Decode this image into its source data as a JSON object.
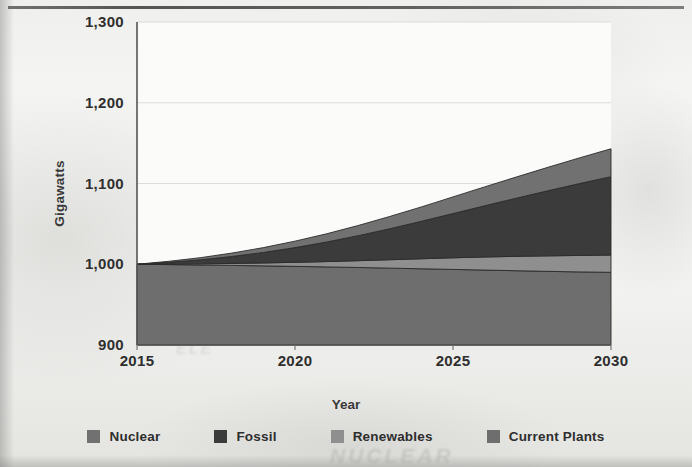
{
  "chart_data": {
    "type": "area",
    "stacked": true,
    "title": "",
    "xlabel": "Year",
    "ylabel": "Gigawatts",
    "x": [
      2015,
      2016,
      2017,
      2018,
      2019,
      2020,
      2021,
      2022,
      2023,
      2024,
      2025,
      2026,
      2027,
      2028,
      2029,
      2030
    ],
    "xlim": [
      2015,
      2030
    ],
    "ylim": [
      900,
      1300
    ],
    "xticks": [
      "2015",
      "2020",
      "2025",
      "2030"
    ],
    "yticks": [
      "900",
      "1,000",
      "1,100",
      "1,200",
      "1,300"
    ],
    "grid": true,
    "legend_position": "bottom",
    "stack_order_bottom_to_top": [
      "Current Plants",
      "Renewables",
      "Fossil",
      "Nuclear"
    ],
    "series": [
      {
        "name": "Current Plants",
        "color": "#6e6e6e",
        "values": [
          100,
          99.6,
          99.1,
          98.6,
          98.0,
          97.4,
          96.7,
          96.0,
          95.2,
          94.4,
          93.6,
          92.8,
          92.0,
          91.2,
          90.5,
          90.0
        ]
      },
      {
        "name": "Renewables",
        "color": "#8f8f8f",
        "values": [
          0,
          0.6,
          1.4,
          2.4,
          3.6,
          5.0,
          6.6,
          8.4,
          10.4,
          12.4,
          14.4,
          16.2,
          17.8,
          19.2,
          20.4,
          21.4
        ]
      },
      {
        "name": "Fossil",
        "color": "#3b3b3b",
        "values": [
          0,
          2.2,
          5.0,
          8.6,
          13.0,
          18.2,
          24.2,
          31.0,
          38.4,
          46.4,
          54.8,
          63.4,
          72.0,
          80.6,
          89.0,
          97.0
        ]
      },
      {
        "name": "Nuclear",
        "color": "#717171",
        "values": [
          0,
          1.2,
          2.6,
          4.2,
          6.0,
          8.0,
          10.2,
          12.6,
          15.2,
          17.8,
          20.6,
          23.4,
          26.2,
          29.0,
          31.8,
          34.6
        ]
      }
    ],
    "cumulative_totals": [
      1000,
      1003.6,
      1008.1,
      1013.8,
      1020.6,
      1028.6,
      1037.7,
      1048.0,
      1059.2,
      1071.0,
      1083.4,
      1095.8,
      1108.0,
      1120.0,
      1131.7,
      1143.0
    ],
    "annotations": []
  },
  "axes": {
    "ylabel": "Gigawatts",
    "xlabel": "Year",
    "yticks": [
      {
        "label": "1,300",
        "value": 1300
      },
      {
        "label": "1,200",
        "value": 1200
      },
      {
        "label": "1,100",
        "value": 1100
      },
      {
        "label": "1,000",
        "value": 1000
      },
      {
        "label": "900",
        "value": 900
      }
    ],
    "xticks": [
      {
        "label": "2015",
        "value": 2015
      },
      {
        "label": "2020",
        "value": 2020
      },
      {
        "label": "2025",
        "value": 2025
      },
      {
        "label": "2030",
        "value": 2030
      }
    ]
  },
  "legend": {
    "items": [
      {
        "label": "Nuclear",
        "color": "#717171"
      },
      {
        "label": "Fossil",
        "color": "#3b3b3b"
      },
      {
        "label": "Renewables",
        "color": "#8f8f8f"
      },
      {
        "label": "Current Plants",
        "color": "#6e6e6e"
      }
    ]
  },
  "artifacts": {
    "faint_mark_top": "~13%",
    "faint_mark_bottom": "NUCLEAR",
    "faint_mark_mid": "ELE"
  }
}
